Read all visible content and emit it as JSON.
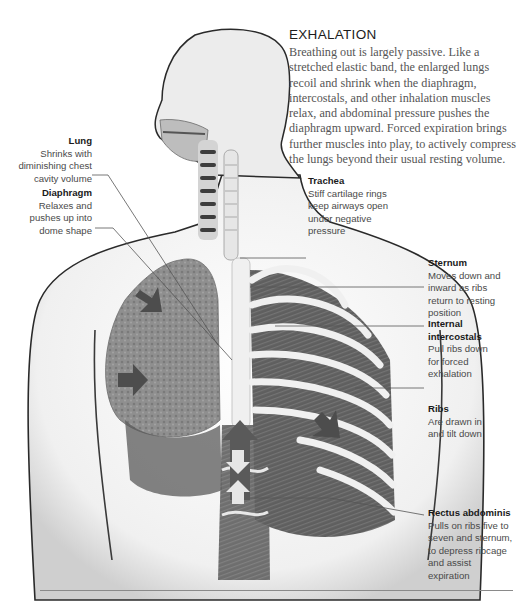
{
  "header": {
    "title": "EXHALATION",
    "intro": "Breathing out is largely passive. Like a stretched elastic band, the enlarged lungs recoil and shrink when the diaphragm, intercostals, and other inhalation muscles relax, and abdominal pressure pushes the diaphragm upward. Forced expiration brings further muscles into play, to actively compress the lungs beyond their usual resting volume."
  },
  "callouts": {
    "lung": {
      "heading": "Lung",
      "body": "Shrinks with diminishing chest cavity volume"
    },
    "diaphragm": {
      "heading": "Diaphragm",
      "body": "Relaxes and pushes up into dome shape"
    },
    "trachea": {
      "heading": "Trachea",
      "body": "Stiff cartilage rings keep airways open under negative pressure"
    },
    "sternum": {
      "heading": "Sternum",
      "body": "Moves down and inward as ribs return to resting position"
    },
    "internal_intercostals": {
      "heading": "Internal intercostals",
      "body": "Pull ribs down for forced exhalation"
    },
    "ribs": {
      "heading": "Ribs",
      "body": "Are drawn in and tilt down"
    },
    "rectus_abdominis": {
      "heading": "Rectus abdominis",
      "body": "Pulls on ribs five to seven and sternum, to depress ribcage and assist expiration"
    }
  },
  "illustration": {
    "subject": "Human torso anatomy during exhalation (grayscale)",
    "arrow_icons": [
      "lung-inward-arrow",
      "lung-inward-arrow",
      "ribs-inward-arrow",
      "abdomen-up-arrow",
      "rectus-double-arrow"
    ],
    "colors": {
      "skin": "#f2f2f2",
      "outline": "#2a2a2a",
      "lung": "#8f8f8f",
      "muscle": "#5e5e5e",
      "bone": "#e8e8e8",
      "arrow": "#4d4d4d",
      "leader": "#555555"
    }
  }
}
